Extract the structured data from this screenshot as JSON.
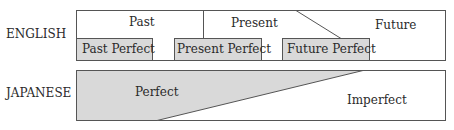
{
  "english": {
    "label": "ENGLISH",
    "tenses": [
      "Past",
      "Present",
      "Future"
    ],
    "perfects": [
      "Past Perfect",
      "Present Perfect",
      "Future Perfect"
    ]
  },
  "japanese": {
    "label": "JAPANESE",
    "aspects": [
      "Perfect",
      "Imperfect"
    ]
  },
  "colors": {
    "fill": "#d9d9d9",
    "stroke": "#555555"
  }
}
